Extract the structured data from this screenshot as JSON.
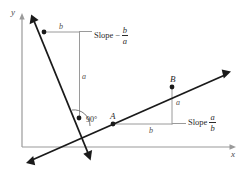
{
  "figure": {
    "axes": {
      "y_label": "y",
      "x_label": "x",
      "axis_color": "#9a9a9a"
    },
    "line_color": "#1a1a1a",
    "guide_color": "#9a9a9a",
    "points": [
      {
        "name": "A",
        "label": "A",
        "x": 113,
        "y": 124
      },
      {
        "name": "B",
        "label": "B",
        "x": 172,
        "y": 87
      }
    ],
    "angle": {
      "label": "90°",
      "x": 82,
      "y": 120
    },
    "steep_line": {
      "rise_label": "a",
      "run_label": "b",
      "slope_word": "Slope",
      "slope_sign": "−",
      "slope_numerator": "b",
      "slope_denominator": "a"
    },
    "shallow_line": {
      "rise_label": "a",
      "run_label": "b",
      "slope_word": "Slope",
      "slope_numerator": "a",
      "slope_denominator": "b"
    }
  }
}
